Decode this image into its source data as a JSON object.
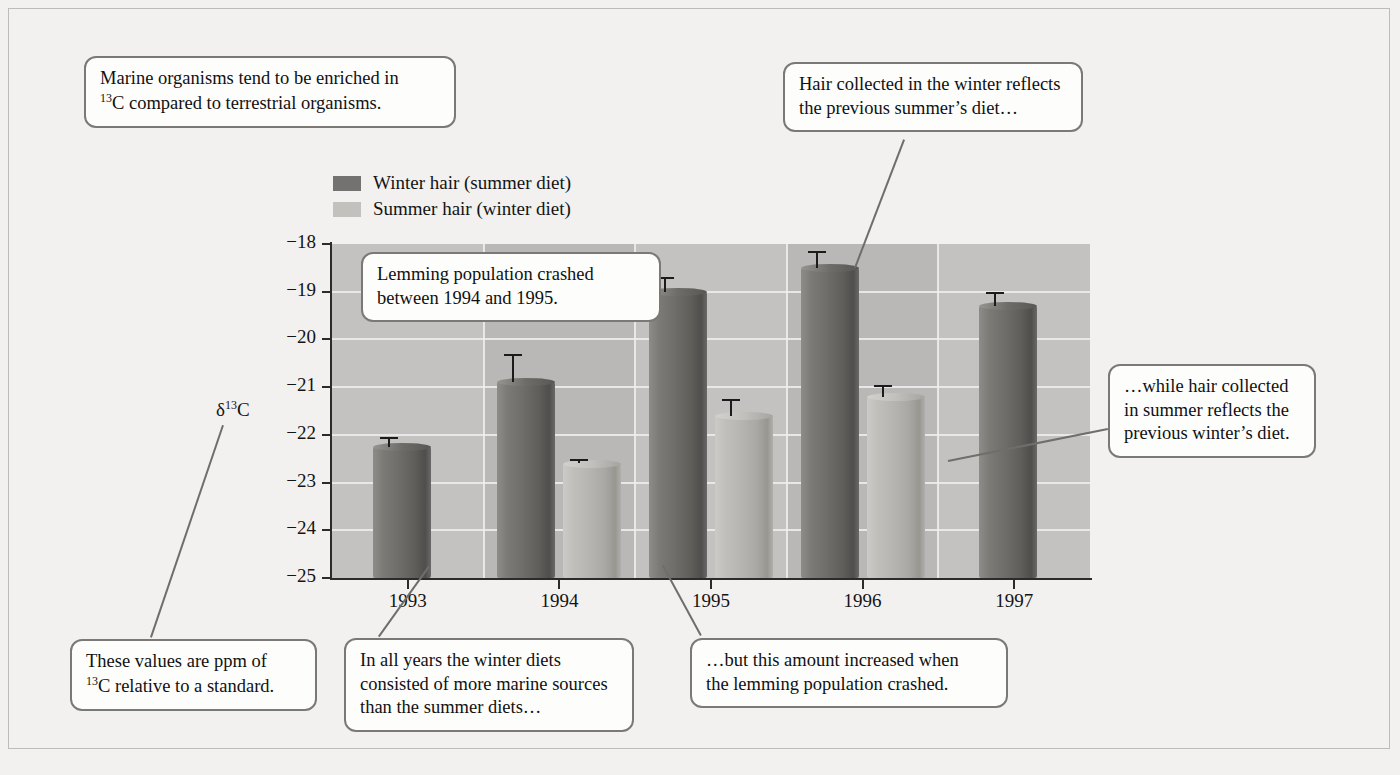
{
  "figure": {
    "y_axis_label_html": "δ<sup>13</sup>C",
    "y_axis_label_text": "δ13C"
  },
  "legend": {
    "position": "above-plot-left",
    "items": [
      {
        "label": "Winter hair (summer diet)",
        "color": "#737270",
        "series": "winter_hair"
      },
      {
        "label": "Summer hair (winter diet)",
        "color": "#c2c1be",
        "series": "summer_hair"
      }
    ]
  },
  "chart_data": {
    "type": "bar",
    "title": "",
    "xlabel": "",
    "ylabel": "δ13C",
    "categories": [
      "1993",
      "1994",
      "1995",
      "1996",
      "1997"
    ],
    "ylim": [
      -25,
      -18
    ],
    "yticks": [
      -18,
      -19,
      -20,
      -21,
      -22,
      -23,
      -24,
      -25
    ],
    "ytick_labels": [
      "−18",
      "−19",
      "−20",
      "−21",
      "−22",
      "−23",
      "−24",
      "−25"
    ],
    "grid": true,
    "legend_position": "above-plot-left",
    "series": [
      {
        "name": "Winter hair (summer diet)",
        "color": "#6e6d6a",
        "values": [
          -22.25,
          -20.9,
          -19.0,
          -18.5,
          -19.3
        ],
        "errors": [
          0.2,
          0.6,
          0.3,
          0.35,
          0.3
        ]
      },
      {
        "name": "Summer hair (winter diet)",
        "color": "#b6b5b2",
        "values": [
          null,
          -22.6,
          -21.6,
          -21.2,
          null
        ],
        "errors": [
          null,
          0.1,
          0.35,
          0.25,
          null
        ]
      }
    ]
  },
  "callouts": [
    {
      "id": "marine-enrichment",
      "lines": [
        "Marine organisms tend to be enriched in",
        "13C compared to terrestrial organisms."
      ],
      "html": "Marine organisms tend to be enriched in<br><sup>13</sup>C compared to terrestrial organisms."
    },
    {
      "id": "winter-hair-summer-diet",
      "lines": [
        "Hair collected in the winter reflects",
        "the previous summer's diet…"
      ],
      "html": "Hair collected in the winter reflects<br>the previous summer’s diet…"
    },
    {
      "id": "lemming-crash",
      "lines": [
        "Lemming population crashed",
        "between 1994 and 1995."
      ],
      "html": "Lemming population crashed<br>between 1994 and 1995."
    },
    {
      "id": "summer-hair-winter-diet",
      "lines": [
        "…while hair collected",
        "in summer reflects the",
        "previous winter's diet."
      ],
      "html": "…while hair collected<br>in summer reflects the<br>previous winter’s diet."
    },
    {
      "id": "ppm-standard",
      "lines": [
        "These values are ppm of",
        "13C relative to a standard."
      ],
      "html": "These values are ppm of<br><sup>13</sup>C relative to a standard."
    },
    {
      "id": "winter-more-marine",
      "lines": [
        "In all years the winter diets",
        "consisted of more marine sources",
        "than the summer diets…"
      ],
      "html": "In all years the winter diets<br>consisted of more marine sources<br>than the summer diets…"
    },
    {
      "id": "amount-increased",
      "lines": [
        "…but this amount increased when",
        "the lemming population crashed."
      ],
      "html": "…but this amount increased when<br>the lemming population crashed."
    }
  ],
  "colors": {
    "page_background": "#f2f1ef",
    "plot_background": "#c3c2c0",
    "plot_band": "#b9b8b6",
    "gridline": "#f0efed",
    "axis": "#2b2b2b",
    "callout_border": "#7a7976",
    "callout_fill": "#fdfdfc",
    "leader_line": "#6f6e6b"
  }
}
